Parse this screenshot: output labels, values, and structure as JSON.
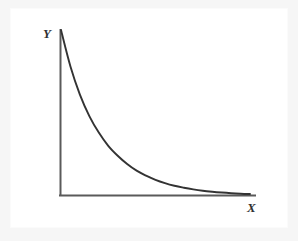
{
  "figure": {
    "background_color": "#f6f6f6",
    "canvas_color": "#ffffff",
    "axis_color": "#5a5a5a",
    "curve_color": "#333333"
  },
  "chart_data": {
    "type": "line",
    "title": "",
    "subtitle": "",
    "xlabel": "X",
    "ylabel": "Y",
    "grid": false,
    "legend": null,
    "axis_style": "two-axis-L-frame",
    "annotations": [],
    "tick_labels": {
      "x": [],
      "y": []
    },
    "xlim": [
      0,
      1
    ],
    "ylim": [
      0,
      1
    ],
    "series": [
      {
        "name": "exponential-decay",
        "x": [
          0.0,
          0.05,
          0.1,
          0.15,
          0.2,
          0.25,
          0.3,
          0.35,
          0.4,
          0.45,
          0.5,
          0.55,
          0.6,
          0.65,
          0.7,
          0.75,
          0.8,
          0.85,
          0.9,
          0.95,
          1.0
        ],
        "y": [
          1.0,
          0.78,
          0.61,
          0.48,
          0.38,
          0.3,
          0.24,
          0.19,
          0.15,
          0.12,
          0.095,
          0.075,
          0.059,
          0.047,
          0.037,
          0.029,
          0.023,
          0.018,
          0.014,
          0.011,
          0.009
        ]
      }
    ]
  },
  "labels": {
    "y": "Y",
    "x": "X"
  }
}
